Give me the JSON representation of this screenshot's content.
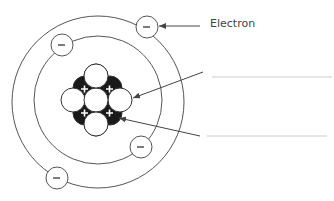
{
  "diagram": {
    "labels": {
      "electron": "Electron",
      "neutron_blank": "",
      "proton_blank": ""
    },
    "symbols": {
      "electron": "−",
      "proton": "+"
    },
    "counts": {
      "electrons": 4,
      "protons": 4,
      "neutrons": 5,
      "orbits": 2
    },
    "colors": {
      "line": "#555555",
      "proton_fill": "#1a1a1a",
      "neutron_fill": "#ffffff",
      "blank_line": "#cccccc"
    }
  }
}
